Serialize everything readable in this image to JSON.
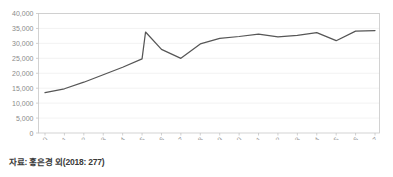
{
  "figure": {
    "source_note": "자료: 홍은경 외(2018: 277)"
  },
  "chart_data": {
    "type": "line",
    "title": "",
    "subtitle": "",
    "xlabel": "",
    "ylabel": "",
    "categories": [
      "2000",
      "2001",
      "2002",
      "2003",
      "2004",
      "2005",
      "2006",
      "2007",
      "2008",
      "2009",
      "2010",
      "2011",
      "2012",
      "2013",
      "2014",
      "2015",
      "2016",
      "2017"
    ],
    "values": [
      13500,
      14800,
      17000,
      19500,
      22000,
      24800,
      28000,
      25000,
      29800,
      31700,
      32300,
      33100,
      32200,
      32700,
      33600,
      30900,
      34100,
      34300
    ],
    "peak_annotation": {
      "label": "mid-2005 spike",
      "x_fraction_between": [
        "2005",
        "2006"
      ],
      "position": 0.18,
      "value": 33800
    },
    "ylim": [
      0,
      40000
    ],
    "yticks": [
      0,
      5000,
      10000,
      15000,
      20000,
      25000,
      30000,
      35000,
      40000
    ],
    "ytick_labels": [
      "0",
      "5,000",
      "10,000",
      "15,000",
      "20,000",
      "25,000",
      "30,000",
      "35,000",
      "40,000"
    ],
    "grid": true,
    "grid_axis": "y",
    "legend": false,
    "legend_position": "none",
    "series": [
      {
        "name": "series-1",
        "color": "#565656",
        "values": [
          13500,
          14800,
          17000,
          19500,
          22000,
          24800,
          28000,
          25000,
          29800,
          31700,
          32300,
          33100,
          32200,
          32700,
          33600,
          30900,
          34100,
          34300
        ]
      }
    ],
    "x_tick_rotation": 45
  }
}
